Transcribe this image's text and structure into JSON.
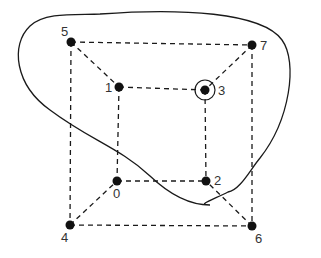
{
  "diagram": {
    "type": "cube-graph",
    "vertices": [
      {
        "id": "0",
        "label": "0"
      },
      {
        "id": "1",
        "label": "1"
      },
      {
        "id": "2",
        "label": "2"
      },
      {
        "id": "3",
        "label": "3",
        "highlighted": true
      },
      {
        "id": "4",
        "label": "4"
      },
      {
        "id": "5",
        "label": "5"
      },
      {
        "id": "6",
        "label": "6"
      },
      {
        "id": "7",
        "label": "7"
      }
    ],
    "edges": [
      [
        "5",
        "7"
      ],
      [
        "5",
        "4"
      ],
      [
        "7",
        "6"
      ],
      [
        "4",
        "6"
      ],
      [
        "1",
        "3"
      ],
      [
        "1",
        "0"
      ],
      [
        "3",
        "2"
      ],
      [
        "0",
        "2"
      ],
      [
        "5",
        "1"
      ],
      [
        "7",
        "3"
      ],
      [
        "4",
        "0"
      ],
      [
        "6",
        "2"
      ]
    ],
    "edge_style": "dashed",
    "enclosed_region": [
      "5",
      "7",
      "1",
      "3"
    ],
    "highlighted_vertex": "3"
  }
}
